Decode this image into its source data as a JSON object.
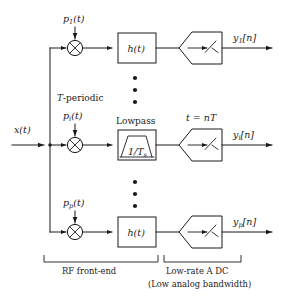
{
  "figure": {
    "background_color": "#ffffff",
    "line_color": "#1a1a1a",
    "width": 282,
    "height": 301
  },
  "input": {
    "label": "x(t)",
    "name": "analog-input-signal"
  },
  "annotations": {
    "periodic_note": "T-periodic",
    "lowpass_note": "Lowpass",
    "sample_instant": "t = nT",
    "lowpass_cutoff": "1/T",
    "lowpass_cutoff_sub": "s"
  },
  "branches": [
    {
      "id": "branch-1",
      "mixer_label": "p",
      "mixer_sub": "1",
      "mixer_suffix": "(t)",
      "filter_label": "h(t)",
      "filter_kind": "impulse-response-box",
      "sampler_label": "sampler",
      "output_label": "y",
      "output_sub": "1",
      "output_suffix": "[n]"
    },
    {
      "id": "branch-i",
      "mixer_label": "p",
      "mixer_sub": "i",
      "mixer_suffix": "(t)",
      "filter_label": "Lowpass",
      "filter_kind": "lowpass-trapezoid",
      "sampler_label": "sampler",
      "output_label": "y",
      "output_sub": "i",
      "output_suffix": "[n]"
    },
    {
      "id": "branch-p",
      "mixer_label": "p",
      "mixer_sub": "p",
      "mixer_suffix": "(t)",
      "filter_label": "h(t)",
      "filter_kind": "impulse-response-box",
      "sampler_label": "sampler",
      "output_label": "y",
      "output_sub": "p",
      "output_suffix": "[n]"
    }
  ],
  "brackets": [
    {
      "id": "rf-front-end",
      "label": "RF front-end",
      "sublabel": ""
    },
    {
      "id": "low-rate-adc",
      "label": "Low-rate A DC",
      "sublabel": "(Low analog bandwidth)"
    }
  ],
  "ellipses": [
    {
      "id": "ellipsis-upper",
      "dots": 3
    },
    {
      "id": "ellipsis-lower",
      "dots": 3
    }
  ]
}
